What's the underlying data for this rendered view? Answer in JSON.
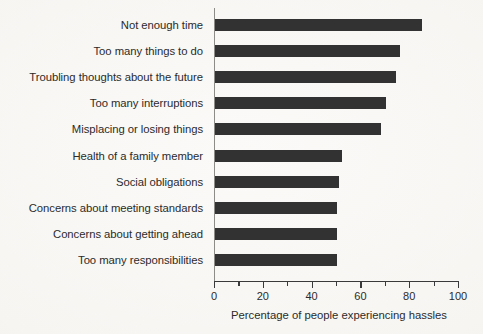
{
  "chart_data": {
    "type": "bar",
    "orientation": "horizontal",
    "title": "",
    "xlabel": "Percentage of people experiencing hassles",
    "ylabel": "",
    "xlim": [
      0,
      100
    ],
    "grid": false,
    "legend": null,
    "bar_color": "#323232",
    "background_color": "#f8f7f5",
    "axis_color": "#3a3a3a",
    "categories": [
      "Not enough time",
      "Too many things to do",
      "Troubling thoughts about the future",
      "Too many interruptions",
      "Misplacing or losing things",
      "Health of a family member",
      "Social obligations",
      "Concerns about meeting standards",
      "Concerns about getting ahead",
      "Too many responsibilities"
    ],
    "values": [
      85,
      76,
      74,
      70,
      68,
      52,
      51,
      50,
      50,
      50
    ],
    "xticks": [
      0,
      20,
      40,
      60,
      80,
      100
    ],
    "xtick_labels": [
      "0",
      "20",
      "40",
      "60",
      "80",
      "100"
    ],
    "xminor_ticks": [
      10,
      30,
      50,
      70,
      90
    ]
  }
}
